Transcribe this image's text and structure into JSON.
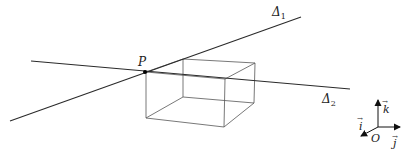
{
  "diagram": {
    "point_label": "P",
    "lines": [
      {
        "name": "Δ",
        "subscript": "1"
      },
      {
        "name": "Δ",
        "subscript": "2"
      }
    ],
    "axes": {
      "origin_label": "O",
      "i_label": "i",
      "j_label": "j",
      "k_label": "k",
      "vector_arrow": "→"
    },
    "colors": {
      "line": "#2a2a2a",
      "box": "#555555"
    }
  }
}
